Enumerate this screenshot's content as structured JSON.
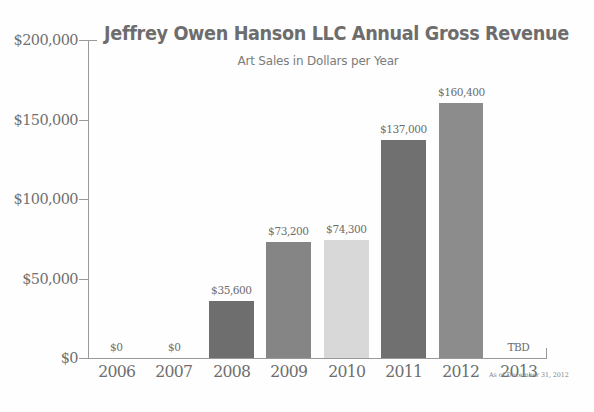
{
  "chart_data": {
    "type": "bar",
    "title": "Jeffrey Owen Hanson LLC Annual Gross Revenue",
    "subtitle": "Art Sales in Dollars per Year",
    "xlabel": "",
    "ylabel": "",
    "ylim": [
      0,
      200000
    ],
    "grid": false,
    "legend": "none",
    "categories": [
      "2006",
      "2007",
      "2008",
      "2009",
      "2010",
      "2011",
      "2012",
      "2013"
    ],
    "values": [
      0,
      0,
      35600,
      73200,
      74300,
      137000,
      160400,
      null
    ],
    "point_labels": [
      "$0",
      "$0",
      "$35,600",
      "$73,200",
      "$74,300",
      "$137,000",
      "$160,400",
      "TBD"
    ],
    "bar_colors": [
      "#ffffff",
      "#ffffff",
      "#6e6e6e",
      "#858585",
      "#d8d8d8",
      "#707070",
      "#8c8c8c",
      "#ffffff"
    ],
    "y_ticks": [
      0,
      50000,
      100000,
      150000,
      200000
    ],
    "y_tick_labels": [
      "$0",
      "$50,000",
      "$100,000",
      "$150,000",
      "$200,000"
    ],
    "annotation": "As of December 31, 2012",
    "axis_color": "#9a9a9a",
    "text_color": "#6e6e6e",
    "background": "#fefefe"
  }
}
